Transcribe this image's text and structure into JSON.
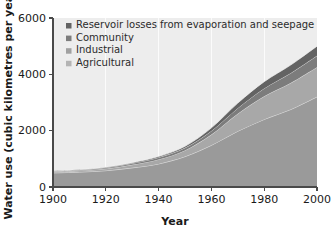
{
  "chart_data": {
    "type": "area",
    "stacked": true,
    "title": "",
    "xlabel": "Year",
    "ylabel": "Water use (cubic kilometres per year)",
    "xlim": [
      1900,
      2000
    ],
    "ylim": [
      0,
      6000
    ],
    "xticks": [
      1900,
      1920,
      1940,
      1960,
      1980,
      2000
    ],
    "yticks": [
      0,
      2000,
      4000,
      6000
    ],
    "grid": "vertical-only",
    "legend_position": "top-left-inside",
    "x": [
      1900,
      1910,
      1920,
      1930,
      1940,
      1950,
      1960,
      1970,
      1980,
      1990,
      2000
    ],
    "series": [
      {
        "name": "Agricultural",
        "color": "#9a9a9a",
        "values": [
          500,
          530,
          580,
          680,
          820,
          1080,
          1480,
          1980,
          2400,
          2750,
          3200
        ]
      },
      {
        "name": "Industrial",
        "color": "#a8a8a8",
        "values": [
          40,
          50,
          70,
          110,
          160,
          220,
          380,
          620,
          820,
          940,
          1050
        ]
      },
      {
        "name": "Community",
        "color": "#7c7c7c",
        "values": [
          20,
          25,
          35,
          50,
          70,
          90,
          130,
          200,
          280,
          350,
          410
        ]
      },
      {
        "name": "Reservoir losses from evaporation and seepage",
        "color": "#636363",
        "values": [
          10,
          12,
          18,
          25,
          35,
          55,
          110,
          180,
          240,
          290,
          340
        ]
      }
    ],
    "totals": [
      570,
      617,
      703,
      865,
      1085,
      1445,
      2100,
      2980,
      3740,
      4330,
      5000
    ]
  },
  "axes": {
    "y_title": "Water use (cubic kilometres per year)",
    "x_title": "Year",
    "y_tick_labels": [
      "0",
      "2000",
      "4000",
      "6000"
    ],
    "x_tick_labels": [
      "1900",
      "1920",
      "1940",
      "1960",
      "1980",
      "2000"
    ]
  },
  "legend": {
    "items": [
      {
        "label": "Reservoir losses from evaporation and seepage",
        "color": "#636363"
      },
      {
        "label": "Community",
        "color": "#7c7c7c"
      },
      {
        "label": "Industrial",
        "color": "#a0a0a0"
      },
      {
        "label": "Agricultural",
        "color": "#b4b4b4"
      }
    ]
  },
  "colors": {
    "plot_background": "#ededed",
    "figure_background": "#ffffff",
    "axis": "#4a4a4a",
    "text": "#1a1a1a",
    "gridline": "#ffffff"
  }
}
